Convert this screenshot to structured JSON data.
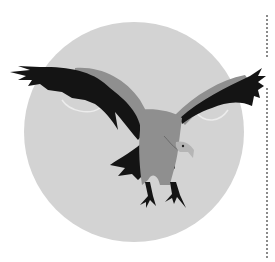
{
  "illustration": {
    "subject": "vulture in flight",
    "background_circle_color": "#d3d3d3",
    "body_color": "#8f8f8f",
    "wing_dark_color": "#141414",
    "head_color": "#b5b5b5"
  },
  "decor": {
    "dotted_line_color": "#8a8a8a"
  }
}
